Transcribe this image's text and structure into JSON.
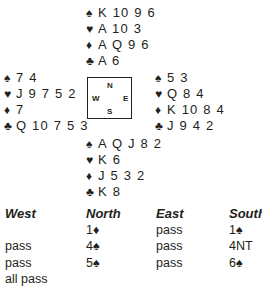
{
  "deal": {
    "north": {
      "spades": "K 10 9 6",
      "hearts": "A 10 3",
      "diamonds": "A Q 9 6",
      "clubs": "A 6"
    },
    "west": {
      "spades": "7 4",
      "hearts": "J 9 7 5 2",
      "diamonds": "7",
      "clubs": "Q 10 7 5 3"
    },
    "east": {
      "spades": "5 3",
      "hearts": "Q 8 4",
      "diamonds": "K 10 8 4",
      "clubs": "J 9 4 2"
    },
    "south": {
      "spades": "A Q J 8 2",
      "hearts": "K 6",
      "diamonds": "J 5 3 2",
      "clubs": "K 8"
    }
  },
  "suit_symbols": {
    "spades": "♠",
    "hearts": "♥",
    "diamonds": "♦",
    "clubs": "♣"
  },
  "compass": {
    "n": "N",
    "s": "S",
    "e": "E",
    "w": "W"
  },
  "auction": {
    "headers": [
      "West",
      "North",
      "East",
      "South"
    ],
    "rows": [
      [
        "",
        "1♦",
        "pass",
        "1♠"
      ],
      [
        "pass",
        "4♠",
        "pass",
        "4NT"
      ],
      [
        "pass",
        "5♠",
        "pass",
        "6♠"
      ],
      [
        "all pass",
        "",
        "",
        ""
      ]
    ]
  }
}
